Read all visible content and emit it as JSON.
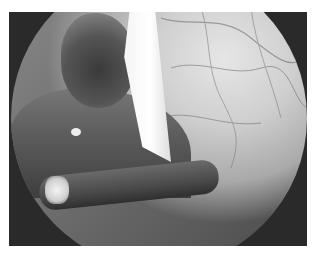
{
  "image": {
    "description": "Grayscale endoscopic/laparoscopic view showing vascularized peritoneal tissue, a white tissue flap, a dark nodular lesion, and a surgical instrument in the lower left",
    "colors": {
      "background": "#ffffff",
      "frame": "#2a2a2a",
      "tissue_light": "#e6e6e6",
      "tissue_dark": "#4a4a4a"
    }
  }
}
